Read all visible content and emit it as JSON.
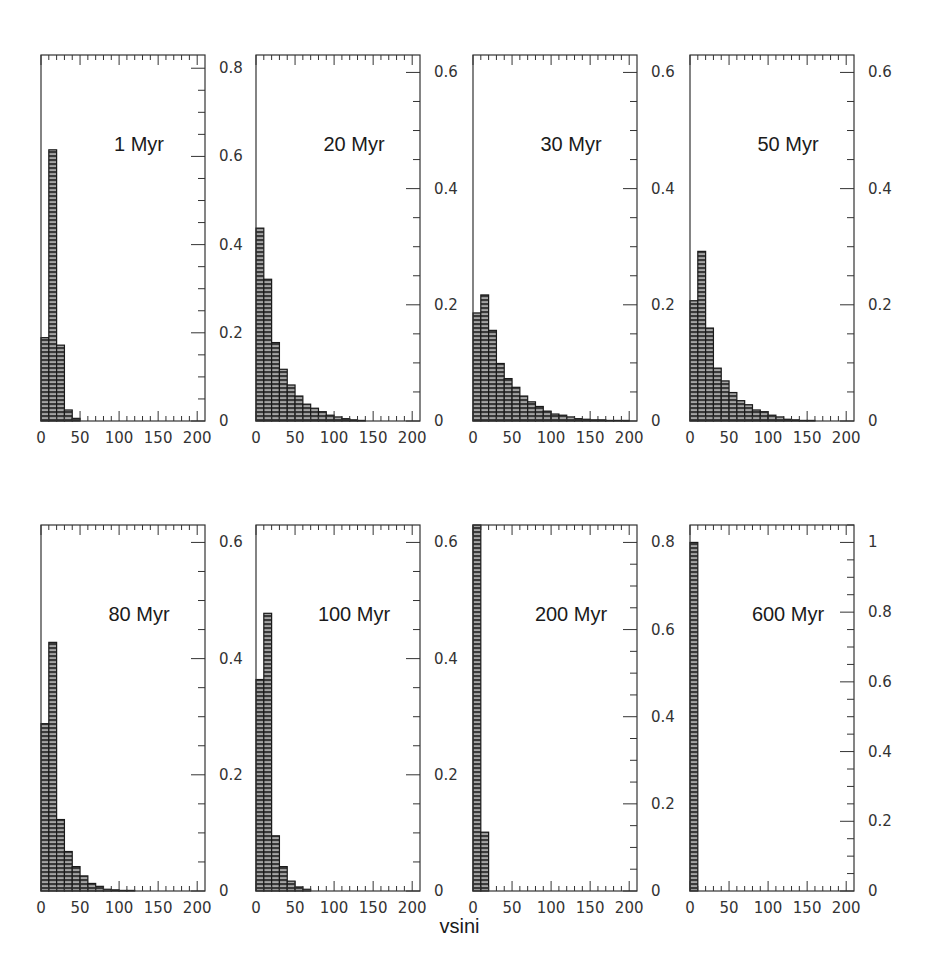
{
  "chart_data": {
    "type": "bar",
    "layout": "2x4 grid of histograms, y-axis ticks on right side",
    "xlabel": "vsini",
    "bin_width": 10,
    "x_range": [
      0,
      210
    ],
    "x_ticks": [
      0,
      50,
      100,
      150,
      200
    ],
    "grid": false,
    "legend": null,
    "panels": [
      {
        "title": "1 Myr",
        "ylim": [
          0,
          0.83
        ],
        "y_ticks": [
          0,
          0.2,
          0.4,
          0.6,
          0.8
        ],
        "y_tick_labels": [
          "0",
          "0.2",
          "0.4",
          "0.6",
          "0.8"
        ],
        "bin_starts": [
          0,
          10,
          20,
          30,
          40
        ],
        "values": [
          0.189,
          0.615,
          0.172,
          0.025,
          0.006
        ]
      },
      {
        "title": "20 Myr",
        "ylim": [
          0,
          0.63
        ],
        "y_ticks": [
          0,
          0.2,
          0.4,
          0.6
        ],
        "y_tick_labels": [
          "0",
          "0.2",
          "0.4",
          "0.6"
        ],
        "bin_starts": [
          0,
          10,
          20,
          30,
          40,
          50,
          60,
          70,
          80,
          90,
          100,
          110,
          120,
          130
        ],
        "values": [
          0.332,
          0.244,
          0.135,
          0.089,
          0.062,
          0.043,
          0.029,
          0.022,
          0.016,
          0.01,
          0.007,
          0.004,
          0.002,
          0.001
        ]
      },
      {
        "title": "30 Myr",
        "ylim": [
          0,
          0.63
        ],
        "y_ticks": [
          0,
          0.2,
          0.4,
          0.6
        ],
        "y_tick_labels": [
          "0",
          "0.2",
          "0.4",
          "0.6"
        ],
        "bin_starts": [
          0,
          10,
          20,
          30,
          40,
          50,
          60,
          70,
          80,
          90,
          100,
          110,
          120,
          130,
          140,
          150,
          160,
          170,
          180,
          190
        ],
        "values": [
          0.186,
          0.217,
          0.156,
          0.099,
          0.073,
          0.058,
          0.043,
          0.033,
          0.025,
          0.017,
          0.012,
          0.01,
          0.007,
          0.004,
          0.003,
          0.002,
          0.002,
          0.001,
          0.001,
          0.001
        ]
      },
      {
        "title": "50 Myr",
        "ylim": [
          0,
          0.63
        ],
        "y_ticks": [
          0,
          0.2,
          0.4,
          0.6
        ],
        "y_tick_labels": [
          "0",
          "0.2",
          "0.4",
          "0.6"
        ],
        "bin_starts": [
          0,
          10,
          20,
          30,
          40,
          50,
          60,
          70,
          80,
          90,
          100,
          110,
          120,
          130,
          140,
          150
        ],
        "values": [
          0.207,
          0.292,
          0.16,
          0.091,
          0.069,
          0.049,
          0.035,
          0.028,
          0.019,
          0.016,
          0.01,
          0.007,
          0.003,
          0.002,
          0.001,
          0.001
        ]
      },
      {
        "title": "80 Myr",
        "ylim": [
          0,
          0.63
        ],
        "y_ticks": [
          0,
          0.2,
          0.4,
          0.6
        ],
        "y_tick_labels": [
          "0",
          "0.2",
          "0.4",
          "0.6"
        ],
        "bin_starts": [
          0,
          10,
          20,
          30,
          40,
          50,
          60,
          70,
          80,
          90,
          100,
          110
        ],
        "values": [
          0.288,
          0.428,
          0.123,
          0.068,
          0.042,
          0.026,
          0.013,
          0.008,
          0.003,
          0.002,
          0.001,
          0.001
        ]
      },
      {
        "title": "100 Myr",
        "ylim": [
          0,
          0.63
        ],
        "y_ticks": [
          0,
          0.2,
          0.4,
          0.6
        ],
        "y_tick_labels": [
          "0",
          "0.2",
          "0.4",
          "0.6"
        ],
        "bin_starts": [
          0,
          10,
          20,
          30,
          40,
          50,
          60
        ],
        "values": [
          0.364,
          0.478,
          0.095,
          0.042,
          0.017,
          0.007,
          0.003
        ]
      },
      {
        "title": "200 Myr",
        "ylim": [
          0,
          0.84
        ],
        "y_ticks": [
          0,
          0.2,
          0.4,
          0.6,
          0.8
        ],
        "y_tick_labels": [
          "0",
          "0.2",
          "0.4",
          "0.6",
          "0.8"
        ],
        "bin_starts": [
          0,
          10
        ],
        "values": [
          0.84,
          0.135
        ]
      },
      {
        "title": "600 Myr",
        "ylim": [
          0,
          1.05
        ],
        "y_ticks": [
          0,
          0.2,
          0.4,
          0.6,
          0.8,
          1.0
        ],
        "y_tick_labels": [
          "0",
          "0.2",
          "0.4",
          "0.6",
          "0.8",
          "1"
        ],
        "bin_starts": [
          0
        ],
        "values": [
          1.0
        ]
      }
    ]
  },
  "figure": {
    "xlabel": "vsini",
    "x_tick_labels": [
      "0",
      "50",
      "100",
      "150",
      "200"
    ],
    "colors": {
      "bar_fill": "#3a3a3a",
      "bar_hatch": "#d8d8d8",
      "axis": "#333333",
      "text": "#1a1a1a"
    }
  }
}
